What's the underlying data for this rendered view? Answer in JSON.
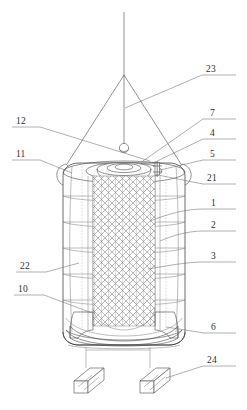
{
  "figure": {
    "drawing_type": "line-drawing",
    "background_color": "#ffffff",
    "line_color": "#4a4a4a",
    "label_color": "#2e2e2e"
  },
  "callouts": {
    "left": [
      {
        "id": "callout-12",
        "number": "12",
        "text_x": 16,
        "text_y": 124,
        "rule_x1": 12,
        "rule_x2": 40,
        "rule_y": 127,
        "leader": "M40,127 L150,161"
      },
      {
        "id": "callout-11",
        "number": "11",
        "text_x": 16,
        "text_y": 157,
        "rule_x1": 12,
        "rule_x2": 40,
        "rule_y": 160,
        "leader": "M40,160 L72,173"
      },
      {
        "id": "callout-22",
        "number": "22",
        "text_x": 20,
        "text_y": 269,
        "rule_x1": 16,
        "rule_x2": 46,
        "rule_y": 272,
        "leader": "M46,272 L79,263"
      },
      {
        "id": "callout-10",
        "number": "10",
        "text_x": 18,
        "text_y": 292,
        "rule_x1": 14,
        "rule_x2": 44,
        "rule_y": 295,
        "leader": "M44,295 L92,313"
      }
    ],
    "right": [
      {
        "id": "callout-23",
        "number": "23",
        "text_x": 206,
        "text_y": 72,
        "rule_x1": 202,
        "rule_x2": 236,
        "rule_y": 75,
        "leader": "M202,75 L125,108"
      },
      {
        "id": "callout-7",
        "number": "7",
        "text_x": 210,
        "text_y": 116,
        "rule_x1": 203,
        "rule_x2": 236,
        "rule_y": 119,
        "leader": "M203,119 L143,161"
      },
      {
        "id": "callout-4",
        "number": "4",
        "text_x": 210,
        "text_y": 136,
        "rule_x1": 203,
        "rule_x2": 236,
        "rule_y": 139,
        "leader": "M203,139 L153,163"
      },
      {
        "id": "callout-5",
        "number": "5",
        "text_x": 210,
        "text_y": 157,
        "rule_x1": 203,
        "rule_x2": 236,
        "rule_y": 160,
        "leader": "M203,160 L160,170"
      },
      {
        "id": "callout-21",
        "number": "21",
        "text_x": 207,
        "text_y": 181,
        "rule_x1": 203,
        "rule_x2": 236,
        "rule_y": 184,
        "leader": "M203,184 L158,175"
      },
      {
        "id": "callout-1",
        "number": "1",
        "text_x": 211,
        "text_y": 206,
        "rule_x1": 204,
        "rule_x2": 236,
        "rule_y": 209,
        "leader": "M204,209 C185,209 168,214 150,221"
      },
      {
        "id": "callout-2",
        "number": "2",
        "text_x": 211,
        "text_y": 228,
        "rule_x1": 204,
        "rule_x2": 236,
        "rule_y": 231,
        "leader": "M204,231 C186,231 172,236 160,241"
      },
      {
        "id": "callout-3",
        "number": "3",
        "text_x": 211,
        "text_y": 259,
        "rule_x1": 204,
        "rule_x2": 236,
        "rule_y": 262,
        "leader": "M204,262 C186,262 166,266 148,269"
      },
      {
        "id": "callout-6",
        "number": "6",
        "text_x": 211,
        "text_y": 330,
        "rule_x1": 204,
        "rule_x2": 236,
        "rule_y": 333,
        "leader": "M204,333 L166,327"
      },
      {
        "id": "callout-24",
        "number": "24",
        "text_x": 207,
        "text_y": 363,
        "rule_x1": 203,
        "rule_x2": 236,
        "rule_y": 366,
        "leader": "M203,366 L166,378"
      }
    ]
  },
  "parts": {
    "hoist_cable": {
      "name": "hoist-cable",
      "x": 124,
      "y_top": 12,
      "y_apex": 75
    },
    "sling_apex": {
      "x": 124,
      "y": 75
    },
    "sling_left_end": {
      "x": 67,
      "y": 164
    },
    "sling_right_end": {
      "x": 181,
      "y": 164
    },
    "lift_ring": {
      "cx": 124,
      "cy": 148,
      "r": 5
    },
    "vessel_body": {
      "left": 63,
      "right": 185,
      "top": 163,
      "bottom": 345
    },
    "lid_boss": {
      "cx": 124,
      "cy": 170
    },
    "mesh_core": {
      "left": 93,
      "right": 155,
      "top": 176,
      "bottom": 326
    },
    "base_block": {
      "top": 312,
      "bottom": 345
    },
    "feet": [
      {
        "name": "foot-left",
        "x": 78,
        "y": 372
      },
      {
        "name": "foot-right",
        "x": 152,
        "y": 372
      }
    ],
    "band_rows": [
      196,
      220,
      246,
      272,
      298
    ],
    "shell_rings": 5
  }
}
